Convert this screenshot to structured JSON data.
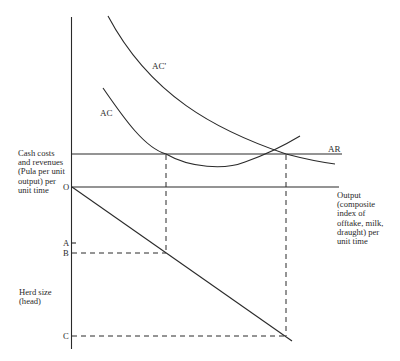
{
  "diagram": {
    "curves": {
      "ac": "AC",
      "ac_prime": "AC'",
      "ar": "AR"
    },
    "axes": {
      "upper_y_label": "Cash costs\nand revenues\n(Pula per unit\noutput) per\nunit time",
      "x_label": "Output\n(composite\nindex of\nofftake, milk,\ndraught) per\nunit time",
      "lower_y_label": "Herd size\n(head)",
      "origin": "O"
    },
    "herd_points": {
      "a": "A",
      "b": "B",
      "c": "C"
    },
    "colors": {
      "ink": "#2a2a2a",
      "background": "#ffffff"
    }
  }
}
